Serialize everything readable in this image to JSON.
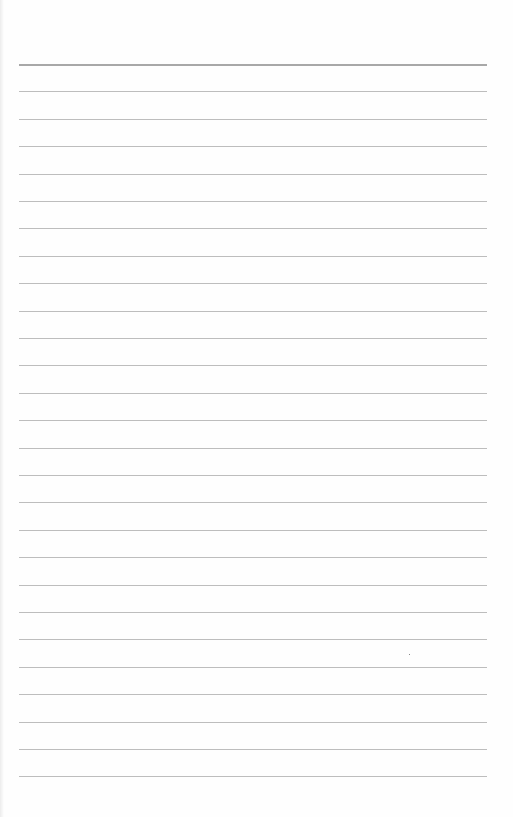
{
  "page": {
    "type": "lined-paper",
    "background_color": "#fefefe",
    "rule_color": "#bdbdbd",
    "top_rule_color": "#a8a8a8",
    "line_count": 27,
    "first_line_y": 64,
    "line_spacing": 27.4,
    "line_left_x": 19,
    "line_width": 468
  }
}
